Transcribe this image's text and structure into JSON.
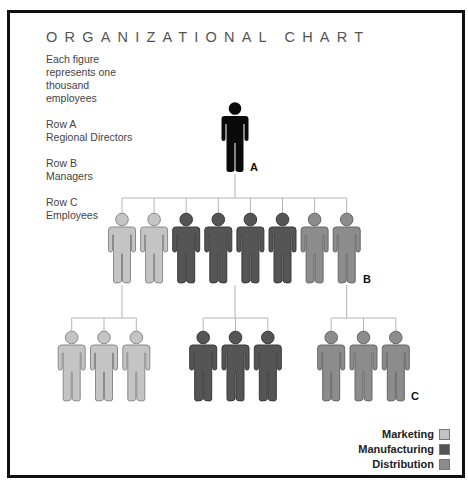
{
  "title": "ORGANIZATIONAL CHART",
  "notes": {
    "scale": [
      "Each figure",
      "represents one",
      "thousand",
      "employees"
    ],
    "row_a": [
      "Row A",
      "Regional Directors"
    ],
    "row_b": [
      "Row B",
      "Managers"
    ],
    "row_c": [
      "Row C",
      "Employees"
    ]
  },
  "row_labels": {
    "a": "A",
    "b": "B",
    "c": "C"
  },
  "departments": [
    {
      "name": "Marketing",
      "color": "#c4c4c4",
      "outline": "#8a8a8a"
    },
    {
      "name": "Manufacturing",
      "color": "#555555",
      "outline": "#3a3a3a"
    },
    {
      "name": "Distribution",
      "color": "#8c8c8c",
      "outline": "#666666"
    }
  ],
  "director_color": "#0a0a0a",
  "connector_color": "#b5b5b5",
  "chart_data": {
    "type": "table",
    "title": "ORGANIZATIONAL CHART",
    "unit": "Each figure represents one thousand employees",
    "rows": [
      {
        "row": "A",
        "role": "Regional Directors",
        "figures": [
          {
            "department": null
          }
        ]
      },
      {
        "row": "B",
        "role": "Managers",
        "figures": [
          {
            "department": "Marketing"
          },
          {
            "department": "Marketing"
          },
          {
            "department": "Manufacturing"
          },
          {
            "department": "Manufacturing"
          },
          {
            "department": "Manufacturing"
          },
          {
            "department": "Manufacturing"
          },
          {
            "department": "Distribution"
          },
          {
            "department": "Distribution"
          }
        ]
      },
      {
        "row": "C",
        "role": "Employees",
        "groups": [
          {
            "department": "Marketing",
            "count": 3
          },
          {
            "department": "Manufacturing",
            "count": 3
          },
          {
            "department": "Distribution",
            "count": 3
          }
        ]
      }
    ],
    "counts": {
      "A": {
        "total": 1
      },
      "B": {
        "Marketing": 2,
        "Manufacturing": 4,
        "Distribution": 2
      },
      "C": {
        "Marketing": 3,
        "Manufacturing": 3,
        "Distribution": 3
      }
    },
    "legend": [
      "Marketing",
      "Manufacturing",
      "Distribution"
    ],
    "legend_position": "bottom-right"
  },
  "credit": "Laura Lamar"
}
